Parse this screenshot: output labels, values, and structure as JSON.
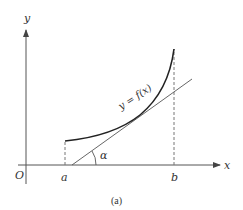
{
  "figure": {
    "caption": "(a)",
    "axes": {
      "x_label": "x",
      "y_label": "y",
      "origin_label": "O"
    },
    "points": {
      "a_label": "a",
      "b_label": "b"
    },
    "curve_label": "y = f(x)",
    "angle_label": "α",
    "colors": {
      "axis": "#555555",
      "curve": "#222222",
      "tangent": "#555555",
      "dashed": "#777777"
    }
  }
}
